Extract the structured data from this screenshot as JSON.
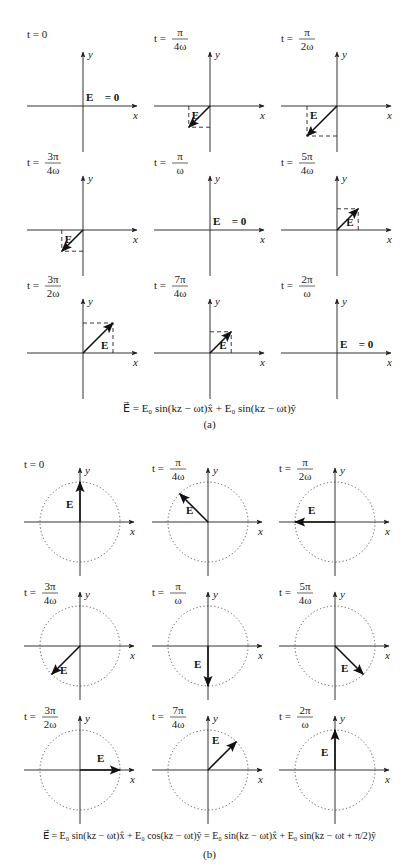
{
  "part_a": {
    "caption": "(a)",
    "equation": "E⃗ = E₀ sin(kz − ωt)x̂ + E₀ sin(kz − ωt)ŷ",
    "axis_labels": {
      "x": "x",
      "y": "y"
    },
    "vector_label": "E⃗",
    "zero_label": "E⃗ = 0",
    "panels": [
      {
        "time": "t = 0",
        "num": "",
        "den": "",
        "ex": 0,
        "ey": 0
      },
      {
        "time": "t =",
        "num": "π",
        "den": "4ω",
        "ex": -0.707,
        "ey": -0.707
      },
      {
        "time": "t =",
        "num": "π",
        "den": "2ω",
        "ex": -1,
        "ey": -1
      },
      {
        "time": "t =",
        "num": "3π",
        "den": "4ω",
        "ex": -0.707,
        "ey": -0.707
      },
      {
        "time": "t =",
        "num": "π",
        "den": "ω",
        "ex": 0,
        "ey": 0
      },
      {
        "time": "t =",
        "num": "5π",
        "den": "4ω",
        "ex": 0.707,
        "ey": 0.707
      },
      {
        "time": "t =",
        "num": "3π",
        "den": "2ω",
        "ex": 1,
        "ey": 1
      },
      {
        "time": "t =",
        "num": "7π",
        "den": "4ω",
        "ex": 0.707,
        "ey": 0.707
      },
      {
        "time": "t =",
        "num": "2π",
        "den": "ω",
        "ex": 0,
        "ey": 0
      }
    ]
  },
  "part_b": {
    "caption": "(b)",
    "equation": "E⃗ = E₀ sin(kz − ωt)x̂ + E₀ cos(kz − ωt)ŷ = E₀ sin(kz − ωt)x̂ + E₀ sin(kz − ωt + π/2)ŷ",
    "axis_labels": {
      "x": "x",
      "y": "y"
    },
    "vector_label": "E⃗",
    "panels": [
      {
        "time": "t = 0",
        "num": "",
        "den": "",
        "ex": 0,
        "ey": 1
      },
      {
        "time": "t =",
        "num": "π",
        "den": "4ω",
        "ex": -0.707,
        "ey": 0.707
      },
      {
        "time": "t =",
        "num": "π",
        "den": "2ω",
        "ex": -1,
        "ey": 0
      },
      {
        "time": "t =",
        "num": "3π",
        "den": "4ω",
        "ex": -0.707,
        "ey": -0.707
      },
      {
        "time": "t =",
        "num": "π",
        "den": "ω",
        "ex": 0,
        "ey": -1
      },
      {
        "time": "t =",
        "num": "5π",
        "den": "4ω",
        "ex": 0.707,
        "ey": -0.707
      },
      {
        "time": "t =",
        "num": "3π",
        "den": "2ω",
        "ex": 1,
        "ey": 0
      },
      {
        "time": "t =",
        "num": "7π",
        "den": "4ω",
        "ex": 0.707,
        "ey": 0.707
      },
      {
        "time": "t =",
        "num": "2π",
        "den": "ω",
        "ex": 0,
        "ey": 1
      }
    ]
  }
}
